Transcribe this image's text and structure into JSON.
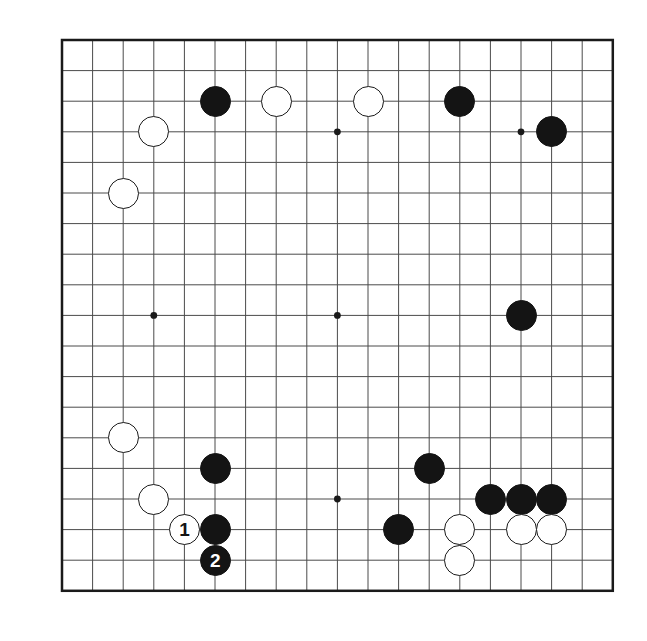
{
  "figure": {
    "kind": "go-board-diagram",
    "board_size": 19,
    "background_color": "#ffffff",
    "line_color": "#4a4a4a",
    "border_color": "#1a1a1a",
    "black_color": "#141414",
    "white_color": "#ffffff"
  },
  "geometry": {
    "origin_x": 62,
    "origin_y": 40,
    "spacing": 30.6,
    "stone_diameter": 31,
    "border_width": 2.5,
    "line_width": 1,
    "star_indices": [
      3,
      9,
      15
    ]
  },
  "stones": [
    {
      "color": "black",
      "col": 5,
      "row": 2,
      "label": ""
    },
    {
      "color": "white",
      "col": 7,
      "row": 2,
      "label": ""
    },
    {
      "color": "white",
      "col": 10,
      "row": 2,
      "label": ""
    },
    {
      "color": "black",
      "col": 13,
      "row": 2,
      "label": ""
    },
    {
      "color": "white",
      "col": 3,
      "row": 3,
      "label": ""
    },
    {
      "color": "black",
      "col": 16,
      "row": 3,
      "label": ""
    },
    {
      "color": "white",
      "col": 2,
      "row": 5,
      "label": ""
    },
    {
      "color": "black",
      "col": 15,
      "row": 9,
      "label": ""
    },
    {
      "color": "white",
      "col": 2,
      "row": 13,
      "label": ""
    },
    {
      "color": "black",
      "col": 5,
      "row": 14,
      "label": ""
    },
    {
      "color": "black",
      "col": 12,
      "row": 14,
      "label": ""
    },
    {
      "color": "white",
      "col": 3,
      "row": 15,
      "label": ""
    },
    {
      "color": "black",
      "col": 14,
      "row": 15,
      "label": ""
    },
    {
      "color": "black",
      "col": 15,
      "row": 15,
      "label": ""
    },
    {
      "color": "black",
      "col": 16,
      "row": 15,
      "label": ""
    },
    {
      "color": "white",
      "col": 4,
      "row": 16,
      "label": "1"
    },
    {
      "color": "black",
      "col": 5,
      "row": 16,
      "label": ""
    },
    {
      "color": "black",
      "col": 11,
      "row": 16,
      "label": ""
    },
    {
      "color": "white",
      "col": 13,
      "row": 16,
      "label": ""
    },
    {
      "color": "white",
      "col": 15,
      "row": 16,
      "label": ""
    },
    {
      "color": "white",
      "col": 16,
      "row": 16,
      "label": ""
    },
    {
      "color": "black",
      "col": 5,
      "row": 17,
      "label": "2"
    },
    {
      "color": "white",
      "col": 13,
      "row": 17,
      "label": ""
    }
  ],
  "move_labels": {
    "move_1": "1",
    "move_2": "2"
  }
}
